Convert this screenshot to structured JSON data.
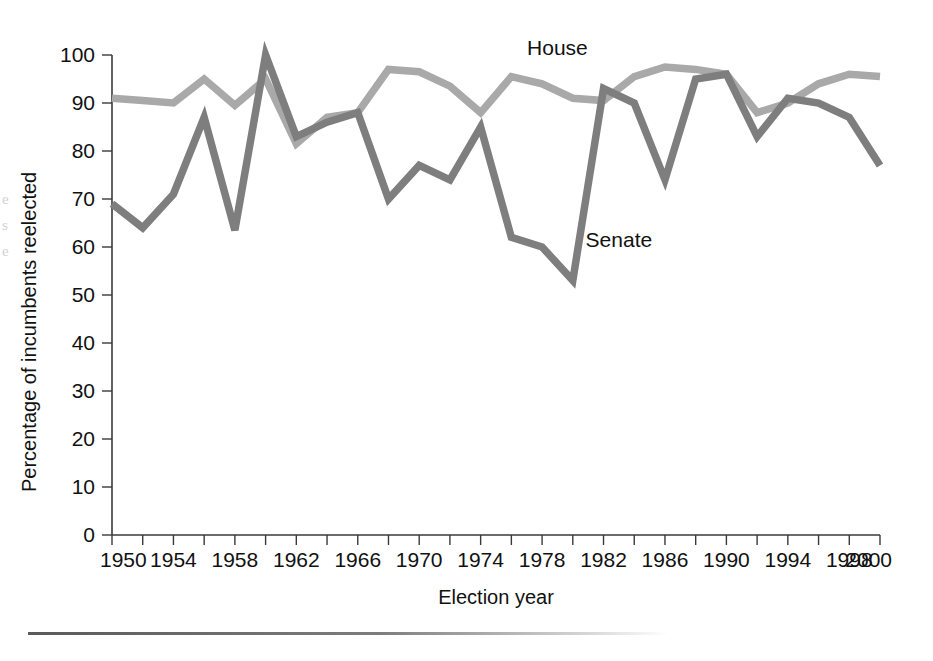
{
  "chart_data": {
    "type": "line",
    "title": "",
    "xlabel": "Election year",
    "ylabel": "Percentage of incumbents reelected",
    "xlim": [
      1950,
      2000
    ],
    "ylim": [
      0,
      100
    ],
    "grid": false,
    "legend_position": "inline-annotation",
    "x": [
      1950,
      1952,
      1954,
      1956,
      1958,
      1960,
      1962,
      1964,
      1966,
      1968,
      1970,
      1972,
      1974,
      1976,
      1978,
      1980,
      1982,
      1984,
      1986,
      1988,
      1990,
      1992,
      1994,
      1996,
      1998,
      2000
    ],
    "xticks_labeled": [
      "1950",
      "1954",
      "1958",
      "1962",
      "1966",
      "1970",
      "1974",
      "1978",
      "1982",
      "1986",
      "1990",
      "1994",
      "1998",
      "2000"
    ],
    "yticks": [
      "0",
      "10",
      "20",
      "30",
      "40",
      "50",
      "60",
      "70",
      "80",
      "90",
      "100"
    ],
    "series": [
      {
        "name": "House",
        "color": "#a9a9a9",
        "values": [
          91,
          90.5,
          90,
          95,
          89.5,
          95,
          81.5,
          87,
          88,
          97,
          96.5,
          93.5,
          88,
          95.5,
          94,
          91,
          90.5,
          95.5,
          97.5,
          97,
          96,
          88,
          90,
          94,
          96,
          95.5
        ]
      },
      {
        "name": "Senate",
        "color": "#7e7e7e",
        "values": [
          69,
          64,
          71,
          87,
          63.5,
          100,
          83,
          86,
          88,
          70,
          77,
          74,
          85,
          62,
          60,
          53,
          93,
          90,
          74,
          95,
          96,
          83,
          91,
          90,
          87,
          77
        ]
      }
    ],
    "annotations": [
      {
        "text": "House",
        "x": 1979,
        "y": 100
      },
      {
        "text": "Senate",
        "x": 1983,
        "y": 60
      }
    ]
  },
  "axes": {
    "x_title": "Election year",
    "y_title": "Percentage of incumbents reelected"
  }
}
